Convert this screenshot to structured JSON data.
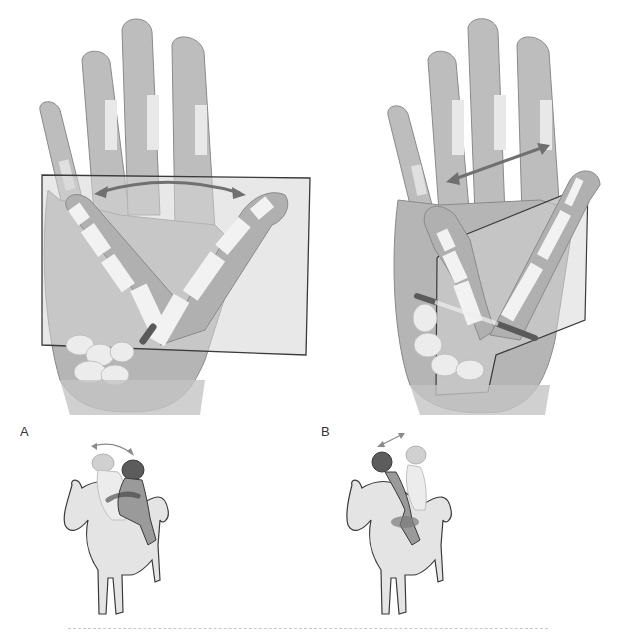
{
  "figure": {
    "panels": [
      {
        "id": "A",
        "label": "A",
        "motion": "abduction-adduction arc in palmar plane",
        "plane_orientation": "frontal rectangle over palm",
        "arrow_type": "curved double-headed",
        "rider_analogy": "rider leaning side to side on horse"
      },
      {
        "id": "B",
        "label": "B",
        "motion": "flexion-extension across palm",
        "plane_orientation": "perpendicular (sagittal) plane through thumb",
        "arrow_type": "straight double-headed",
        "rider_analogy": "rider leaning forward and back on horse"
      }
    ],
    "colors": {
      "skin": "#bdbdbd",
      "skin_dark": "#9e9e9e",
      "skin_outline": "#8a8a8a",
      "bone": "#f2f2f2",
      "plane_fill": "#d6d6d6",
      "plane_stroke": "#3a3a3a",
      "axis_rod": "#5a5a5a",
      "arrow": "#707070",
      "horse_fill": "#e4e4e4",
      "horse_stroke": "#3a3a3a",
      "rider_dark": "#5c5c5c",
      "rider_mid": "#9a9a9a",
      "rider_ghost": "#d0d0d0",
      "divider": "#c8c8c8"
    }
  }
}
